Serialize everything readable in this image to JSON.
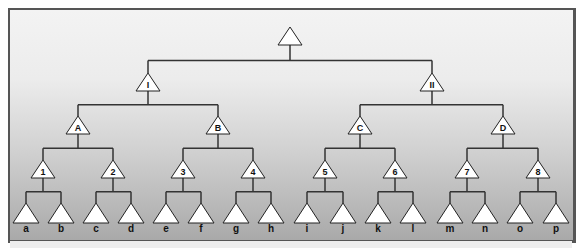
{
  "diagram": {
    "type": "tree",
    "colors": {
      "frame_border": "#555555",
      "line": "#333333",
      "node_fill": "#ffffff",
      "node_stroke": "#222222",
      "bg_top": "#f3f3f3",
      "bg_bottom": "#a9a9a9"
    },
    "root": {
      "label": "",
      "x": 290,
      "y": 36
    },
    "level1": [
      {
        "label": "I",
        "x": 148,
        "y": 82
      },
      {
        "label": "II",
        "x": 432,
        "y": 82
      }
    ],
    "level2": [
      {
        "label": "A",
        "x": 78,
        "y": 125
      },
      {
        "label": "B",
        "x": 218,
        "y": 125
      },
      {
        "label": "C",
        "x": 360,
        "y": 125
      },
      {
        "label": "D",
        "x": 503,
        "y": 125
      }
    ],
    "level3": [
      {
        "label": "1",
        "x": 43,
        "y": 169
      },
      {
        "label": "2",
        "x": 113,
        "y": 169
      },
      {
        "label": "3",
        "x": 183,
        "y": 169
      },
      {
        "label": "4",
        "x": 253,
        "y": 169
      },
      {
        "label": "5",
        "x": 325,
        "y": 169
      },
      {
        "label": "6",
        "x": 395,
        "y": 169
      },
      {
        "label": "7",
        "x": 467,
        "y": 169
      },
      {
        "label": "8",
        "x": 538,
        "y": 169
      }
    ],
    "leaves": [
      {
        "label": "a",
        "x": 26
      },
      {
        "label": "b",
        "x": 61
      },
      {
        "label": "c",
        "x": 96
      },
      {
        "label": "d",
        "x": 131
      },
      {
        "label": "e",
        "x": 166
      },
      {
        "label": "f",
        "x": 201
      },
      {
        "label": "g",
        "x": 236
      },
      {
        "label": "h",
        "x": 271
      },
      {
        "label": "i",
        "x": 307
      },
      {
        "label": "j",
        "x": 343
      },
      {
        "label": "k",
        "x": 378
      },
      {
        "label": "l",
        "x": 413
      },
      {
        "label": "m",
        "x": 450
      },
      {
        "label": "n",
        "x": 485
      },
      {
        "label": "o",
        "x": 520
      },
      {
        "label": "p",
        "x": 556
      }
    ],
    "leaf_y": 213,
    "leaf_label_y": 232
  }
}
